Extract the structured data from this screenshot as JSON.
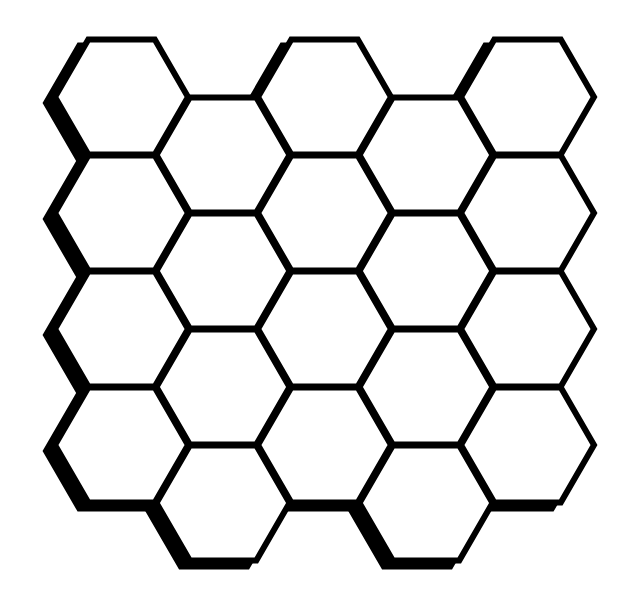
{
  "grid": {
    "columns": 5,
    "rows_per_column": 4,
    "total_cells": 20,
    "orientation": "flat-top",
    "origin_x": 121.5,
    "origin_y": 97,
    "radius": 66.5,
    "col_pitch": 101.5,
    "row_pitch": 116,
    "odd_col_offset": 58,
    "stroke_width": 6,
    "shadow_dx": -9,
    "shadow_dy": 6
  },
  "colors": {
    "background": "#ffffff",
    "stroke": "#000000",
    "fill": "#ffffff",
    "shadow": "#000000"
  }
}
